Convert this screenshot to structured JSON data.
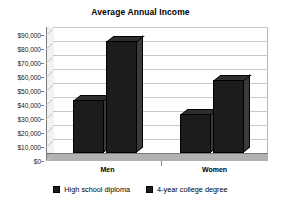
{
  "chart_data": {
    "type": "bar",
    "title": "Average Annual Income",
    "xlabel": "",
    "ylabel": "",
    "categories": [
      "Men",
      "Women"
    ],
    "series": [
      {
        "name": "High school diploma",
        "values": [
          38000,
          28000
        ],
        "color": "#1c1c1c"
      },
      {
        "name": "4-year college degree",
        "values": [
          80000,
          52000
        ],
        "color": "#1c1c1c"
      }
    ],
    "ylim": [
      0,
      90000
    ],
    "ytick_values": [
      0,
      10000,
      20000,
      30000,
      40000,
      50000,
      60000,
      70000,
      80000,
      90000
    ],
    "ytick_labels": [
      "$0",
      "$10,000",
      "$20,000",
      "$30,000",
      "$40,000",
      "$50,000",
      "$60,000",
      "$70,000",
      "$80,000",
      "$90,000"
    ],
    "grid": true,
    "legend_position": "bottom",
    "style": "3d-column"
  },
  "legend": {
    "items": [
      {
        "label": "High school diploma"
      },
      {
        "label": "4-year college degree"
      }
    ]
  }
}
